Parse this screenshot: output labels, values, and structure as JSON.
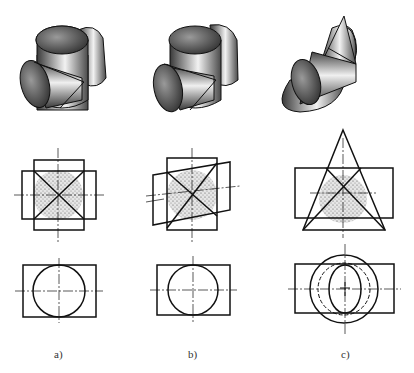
{
  "figure": {
    "columns": [
      {
        "id": "a",
        "label": "a)",
        "solid": "two equal cylinders intersecting at right angles (axes intersect)"
      },
      {
        "id": "b",
        "label": "b)",
        "solid": "two equal cylinders intersecting with inclined axis"
      },
      {
        "id": "c",
        "label": "c)",
        "solid": "cone and cylinder sharing common inscribed sphere"
      }
    ],
    "rows": [
      "isometric view",
      "front view (intersection lines shown as straight crossed lines, sphere shaded)",
      "top view"
    ]
  },
  "colors": {
    "line": "#1a1a1a",
    "fill_dark": "#3a3a3a",
    "fill_light": "#e8e8e8",
    "sphere_fill": "#d9d9d9"
  }
}
